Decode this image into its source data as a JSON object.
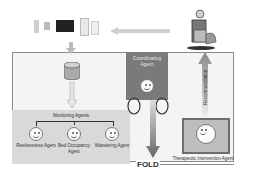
{
  "diagram": {
    "sensors_label": "",
    "coordinating_agent": "Coordinating Agent",
    "monitoring_agents_label": "Monitoring Agents",
    "monitoring_agents": [
      {
        "label": "Restlessness Agent"
      },
      {
        "label": "Bed Occupancy Agent"
      },
      {
        "label": "Wandering Agent"
      }
    ],
    "therapeutic_agent": "Therapeutic intervention Agent",
    "recommendation_label": "Recommendation",
    "fold_label": "FOLD",
    "icons": [
      "sensor-device-icon",
      "database-icon",
      "smiley-agent-icon",
      "elderly-person-in-chair-icon"
    ],
    "colors": {
      "coordinating_fill": "#7a7a7a",
      "monitor_fill": "#d9d9d9",
      "therapeutic_fill": "#bdbdbd",
      "frame_border": "#8a8a8a"
    }
  }
}
